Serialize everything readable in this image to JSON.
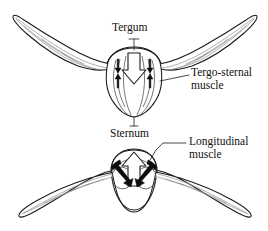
{
  "figure": {
    "stroke_color": "#1a1a1a",
    "vein_color": "#8d8d8d",
    "fill_color": "#ffffff",
    "background": "#ffffff"
  },
  "labels": {
    "tergum": "Tergum",
    "tergo_sternal_line1": "Tergo-sternal",
    "tergo_sternal_line2": "muscle",
    "sternum": "Sternum",
    "longitudinal_line1": "Longitudinal",
    "longitudinal_line2": "muscle"
  },
  "panels": [
    {
      "name": "upstroke-panel",
      "position": "top",
      "wing_position": "raised",
      "center_arrow": "large-hollow-down-arrow",
      "side_arrows": "paired-solid-vertical-arrows",
      "annotated_parts": [
        "Tergum",
        "Tergo-sternal muscle",
        "Sternum"
      ]
    },
    {
      "name": "downstroke-panel",
      "position": "bottom",
      "wing_position": "lowered",
      "center_arrow": "large-hollow-up-arrow",
      "side_arrows": "diagonal-solid-arrows",
      "annotated_parts": [
        "Longitudinal muscle"
      ]
    }
  ]
}
